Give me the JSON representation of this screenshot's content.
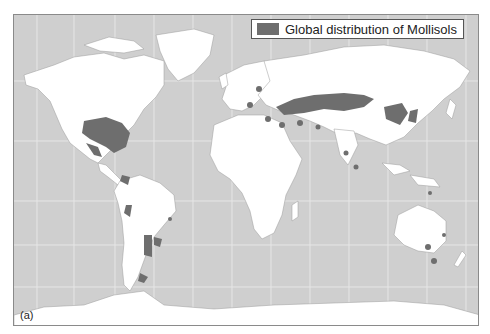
{
  "legend": {
    "label": "Global distribution of Mollisols",
    "swatch_color": "#6e6e6e"
  },
  "panel_label": "(a)",
  "colors": {
    "ocean": "#cfcfcf",
    "land": "#ffffff",
    "mollisols": "#6e6e6e",
    "gridlines": "#e6e6e6",
    "borders": "#9a9a9a"
  },
  "map": {
    "projection": "world map with graticule",
    "regions_with_mollisols": [
      "Great Plains (North America)",
      "Mexico",
      "Central America",
      "Andes (Peru/Ecuador)",
      "Pampas (Argentina/Uruguay)",
      "Patagonia",
      "Southern Brazil",
      "Eastern Europe / Ukraine",
      "Russian steppe / Kazakhstan",
      "Mongolia / Northeast China",
      "Turkey / Middle East",
      "India",
      "Southeast Australia",
      "Tasmania",
      "New Guinea"
    ]
  }
}
